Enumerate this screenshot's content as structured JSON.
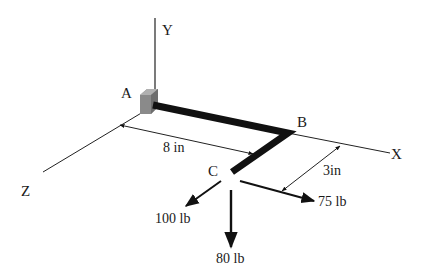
{
  "diagram": {
    "axes": {
      "y_label": "Y",
      "x_label": "X",
      "z_label": "Z"
    },
    "points": {
      "a_label": "A",
      "b_label": "B",
      "c_label": "C"
    },
    "dimensions": {
      "ab_length": "8 in",
      "bc_length": "3in"
    },
    "forces": {
      "z_force": "100 lb",
      "y_force": "80 lb",
      "x_force": "75 lb"
    },
    "colors": {
      "rod": "#111111",
      "line": "#222222",
      "support": "#8a8a8a"
    }
  }
}
